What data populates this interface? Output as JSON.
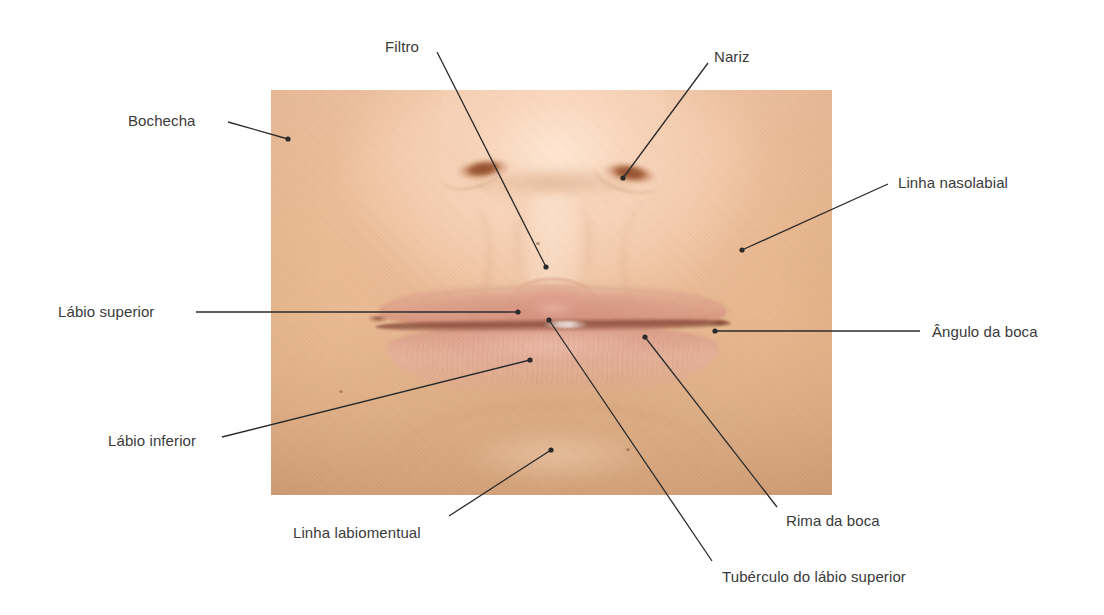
{
  "figure": {
    "kind": "anatomical-photo-diagram",
    "language": "pt-BR",
    "background_color": "#ffffff",
    "label_color": "#3a3a3a",
    "leader_color": "#2b2b2b",
    "photo": {
      "x": 271,
      "y": 90,
      "width": 561,
      "height": 405
    }
  },
  "labels": [
    {
      "id": "bochecha",
      "text": "Bochecha",
      "text_x": 128,
      "text_y": 112,
      "line": [
        [
          228,
          122
        ],
        [
          288,
          139
        ]
      ],
      "dot": [
        288,
        139
      ]
    },
    {
      "id": "filtro",
      "text": "Filtro",
      "text_x": 385,
      "text_y": 38,
      "line": [
        [
          437,
          52
        ],
        [
          546,
          267
        ]
      ],
      "dot": [
        546,
        267
      ]
    },
    {
      "id": "nariz",
      "text": "Nariz",
      "text_x": 714,
      "text_y": 48,
      "line": [
        [
          708,
          63
        ],
        [
          623,
          178
        ]
      ],
      "dot": [
        623,
        178
      ]
    },
    {
      "id": "linha-nasolabial",
      "text": "Linha nasolabial",
      "text_x": 898,
      "text_y": 174,
      "line": [
        [
          888,
          184
        ],
        [
          742,
          250
        ]
      ],
      "dot": [
        742,
        250
      ]
    },
    {
      "id": "labio-superior",
      "text": "Lábio superior",
      "text_x": 58,
      "text_y": 303,
      "line": [
        [
          196,
          312
        ],
        [
          518,
          312
        ]
      ],
      "dot": [
        518,
        312
      ]
    },
    {
      "id": "angulo-da-boca",
      "text": "Ângulo da boca",
      "text_x": 932,
      "text_y": 323,
      "line": [
        [
          920,
          331
        ],
        [
          715,
          331
        ]
      ],
      "dot": [
        715,
        331
      ]
    },
    {
      "id": "labio-inferior",
      "text": "Lábio inferior",
      "text_x": 108,
      "text_y": 432,
      "line": [
        [
          222,
          437
        ],
        [
          530,
          360
        ]
      ],
      "dot": [
        530,
        360
      ]
    },
    {
      "id": "linha-labiomentual",
      "text": "Linha labiomentual",
      "text_x": 293,
      "text_y": 524,
      "line": [
        [
          449,
          516
        ],
        [
          551,
          450
        ]
      ],
      "dot": [
        551,
        450
      ]
    },
    {
      "id": "rima-da-boca",
      "text": "Rima da boca",
      "text_x": 786,
      "text_y": 512,
      "line": [
        [
          777,
          507
        ],
        [
          645,
          337
        ]
      ],
      "dot": [
        645,
        337
      ]
    },
    {
      "id": "tuberculo-do-labio-superior",
      "text": "Tubérculo do lábio superior",
      "text_x": 722,
      "text_y": 568,
      "line": [
        [
          712,
          561
        ],
        [
          549,
          320
        ]
      ],
      "dot": [
        549,
        320
      ]
    }
  ]
}
